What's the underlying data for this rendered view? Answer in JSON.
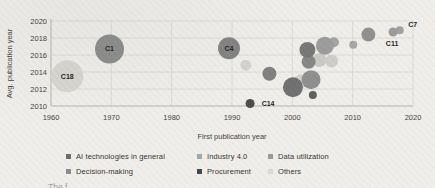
{
  "figure": {
    "caption_fragment": "The f"
  },
  "chart_data": {
    "type": "bubble",
    "title": "",
    "xlabel": "First publication year",
    "ylabel": "Avg. publication year",
    "xlim": [
      1960,
      2020
    ],
    "ylim": [
      2010,
      2020
    ],
    "xticks": [
      1960,
      1970,
      1980,
      1990,
      2000,
      2010,
      2020
    ],
    "yticks": [
      2010,
      2012,
      2014,
      2016,
      2018,
      2020
    ],
    "grid": true,
    "legend": {
      "position": "bottom",
      "rows": [
        [
          {
            "label": "AI technologies in general",
            "color": "#6b6b6b"
          },
          {
            "label": "Industry 4.0",
            "color": "#a6a6a6"
          },
          {
            "label": "Data utilization",
            "color": "#999999"
          }
        ],
        [
          {
            "label": "Decision-making",
            "color": "#8c8c8c"
          },
          {
            "label": "Procurement",
            "color": "#454545"
          },
          {
            "label": "Others",
            "color": "#dcdad6"
          }
        ]
      ]
    },
    "bubbles": [
      {
        "label": "C18",
        "x": 1962.7,
        "y": 2013.5,
        "r": 16,
        "color": "#d8d6d1",
        "label_dx": 0,
        "label_dy": 0
      },
      {
        "label": "",
        "x": 1992.3,
        "y": 2014.8,
        "r": 5.5,
        "color": "#d5d3ce"
      },
      {
        "label": "",
        "x": 2001.4,
        "y": 2012.9,
        "r": 7,
        "color": "#d2d0cb"
      },
      {
        "label": "",
        "x": 2004.5,
        "y": 2015.4,
        "r": 7,
        "color": "#cbc9c4"
      },
      {
        "label": "",
        "x": 2006.5,
        "y": 2015.3,
        "r": 6.5,
        "color": "#cfcdc8"
      },
      {
        "label": "",
        "x": 2010.1,
        "y": 2017.2,
        "r": 4,
        "color": "#a5a5a5"
      },
      {
        "label": "",
        "x": 2006.9,
        "y": 2017.5,
        "r": 5,
        "color": "#a3a3a3"
      },
      {
        "label": "",
        "x": 2005.4,
        "y": 2017.1,
        "r": 9,
        "color": "#9b9b9b"
      },
      {
        "label": "",
        "x": 2012.6,
        "y": 2018.4,
        "r": 7,
        "color": "#8f8f8f"
      },
      {
        "label": "C7",
        "x": 2017.8,
        "y": 2018.9,
        "r": 4,
        "color": "#a0a0a0",
        "label_dx": 13,
        "label_dy": -6
      },
      {
        "label": "C11",
        "x": 2016.7,
        "y": 2018.7,
        "r": 4.5,
        "color": "#9a9a9a",
        "label_dx": -1,
        "label_dy": 12
      },
      {
        "label": "",
        "x": 2003.1,
        "y": 2013.1,
        "r": 9.5,
        "color": "#8e8e8e"
      },
      {
        "label": "",
        "x": 2002.7,
        "y": 2015.2,
        "r": 7,
        "color": "#868686"
      },
      {
        "label": "",
        "x": 2002.5,
        "y": 2016.6,
        "r": 8,
        "color": "#767676"
      },
      {
        "label": "",
        "x": 2000.1,
        "y": 2012.2,
        "r": 10,
        "color": "#6f6f6f"
      },
      {
        "label": "",
        "x": 2003.4,
        "y": 2011.3,
        "r": 4,
        "color": "#5f5f5f"
      },
      {
        "label": "",
        "x": 1996.2,
        "y": 2013.8,
        "r": 7,
        "color": "#7e7e7e"
      },
      {
        "label": "C1",
        "x": 1969.7,
        "y": 2016.7,
        "r": 14.5,
        "color": "#8c8c8c",
        "label_dx": 0,
        "label_dy": 0
      },
      {
        "label": "C4",
        "x": 1989.5,
        "y": 2016.8,
        "r": 11,
        "color": "#828282",
        "label_dx": 0,
        "label_dy": 0
      },
      {
        "label": "C14",
        "x": 1993.0,
        "y": 2010.3,
        "r": 4.5,
        "color": "#4a4a4a",
        "label_dx": 18,
        "label_dy": 0.5
      }
    ]
  }
}
